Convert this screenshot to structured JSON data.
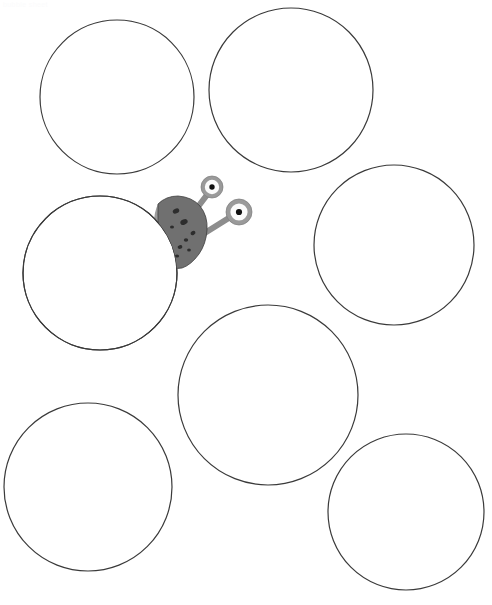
{
  "canvas": {
    "width": 492,
    "height": 605,
    "background_color": "#ffffff",
    "corner_label": "bubble sheet",
    "corner_label_color": "#fbfbfc"
  },
  "style": {
    "circle_stroke_color": "#3a3a3a",
    "circle_stroke_width": 1.2,
    "circle_fill_color": "#ffffff",
    "creature_body_color": "#707070",
    "creature_body_edge_color": "#3f3f3f",
    "creature_spot_color": "#2d2d2d",
    "eye_ring_color": "#9a9a9a",
    "eye_white_color": "#fbfbfb",
    "eye_pupil_color": "#111111",
    "stalk_color": "#8d8d8d"
  },
  "circles": [
    {
      "name": "circle-top-left",
      "cx": 117,
      "cy": 97,
      "r": 77
    },
    {
      "name": "circle-top-right",
      "cx": 291,
      "cy": 90,
      "r": 82
    },
    {
      "name": "circle-middle-left",
      "cx": 100,
      "cy": 273,
      "r": 77
    },
    {
      "name": "circle-middle-right",
      "cx": 394,
      "cy": 245,
      "r": 80
    },
    {
      "name": "circle-bottom-center",
      "cx": 268,
      "cy": 395,
      "r": 90
    },
    {
      "name": "circle-bottom-left",
      "cx": 88,
      "cy": 487,
      "r": 84
    },
    {
      "name": "circle-bottom-right",
      "cx": 406,
      "cy": 512,
      "r": 78
    }
  ],
  "creature": {
    "name": "alien-creature",
    "body_path": "M 158 204 Q 166 196 178 196 Q 192 197 200 206 Q 208 216 207 230 Q 206 244 199 254 Q 191 265 182 268 Q 172 270 168 262 Q 163 250 160 236 Q 157 220 158 204 Z",
    "body_shade_path": "M 158 204 Q 157 222 161 240 Q 165 258 170 267 Q 165 268 162 262 Q 156 248 154 230 Q 153 214 158 204 Z",
    "spots": [
      {
        "cx": 176,
        "cy": 211,
        "rx": 3.4,
        "ry": 2.4,
        "rot": -28
      },
      {
        "cx": 184,
        "cy": 222,
        "rx": 3.8,
        "ry": 2.6,
        "rot": -22
      },
      {
        "cx": 172,
        "cy": 227,
        "rx": 2.0,
        "ry": 1.6,
        "rot": 0
      },
      {
        "cx": 193,
        "cy": 233,
        "rx": 2.6,
        "ry": 2.0,
        "rot": -30
      },
      {
        "cx": 186,
        "cy": 240,
        "rx": 2.2,
        "ry": 1.7,
        "rot": 0
      },
      {
        "cx": 180,
        "cy": 247,
        "rx": 2.4,
        "ry": 1.9,
        "rot": -15
      },
      {
        "cx": 189,
        "cy": 250,
        "rx": 1.9,
        "ry": 1.5,
        "rot": 0
      },
      {
        "cx": 177,
        "cy": 256,
        "rx": 2.1,
        "ry": 1.6,
        "rot": 0
      }
    ],
    "stalks": [
      {
        "name": "eye-stalk-upper",
        "x1": 197,
        "y1": 208,
        "x2": 210,
        "y2": 191,
        "width": 6
      },
      {
        "name": "eye-stalk-lower",
        "x1": 200,
        "y1": 236,
        "x2": 232,
        "y2": 216,
        "width": 6
      }
    ],
    "eyes": [
      {
        "name": "eye-upper",
        "cx": 212,
        "cy": 187,
        "r_outer": 11.0,
        "r_white": 7.2,
        "r_pupil": 2.7
      },
      {
        "name": "eye-lower",
        "cx": 239,
        "cy": 212,
        "r_outer": 13.0,
        "r_white": 8.6,
        "r_pupil": 3.1
      }
    ]
  }
}
